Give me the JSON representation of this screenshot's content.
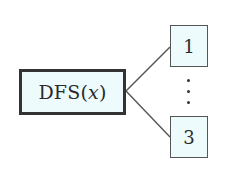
{
  "diagram": {
    "type": "tree",
    "root": {
      "label_prefix": "DFS(",
      "label_var": "x",
      "label_suffix": ")",
      "full_label": "DFS(x)"
    },
    "children": [
      {
        "label": "1"
      },
      {
        "label": "3"
      }
    ],
    "ellipsis": "⋮",
    "colors": {
      "node_fill": "#eefbfd",
      "root_border": "#333333",
      "child_border": "#555555",
      "edge": "#555555",
      "text": "#2a2a2a"
    }
  }
}
